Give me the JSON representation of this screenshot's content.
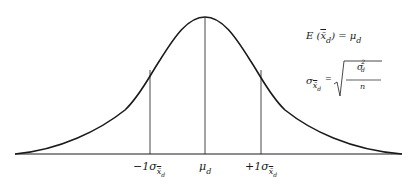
{
  "diagram": {
    "type": "normal-distribution-curve",
    "colors": {
      "line": "#1a1a1a",
      "background": "#ffffff"
    },
    "axis_labels": {
      "minus_one_sigma": {
        "prefix": "−1σ",
        "sub": "x̄",
        "subsub": "d"
      },
      "mean": {
        "main": "μ",
        "sub": "d"
      },
      "plus_one_sigma": {
        "prefix": "+1σ",
        "sub": "x̄",
        "subsub": "d"
      }
    },
    "formulas": {
      "expectation": {
        "lhs": "E (",
        "var": "x̄",
        "var_sub": "d",
        "close": ") = ",
        "rhs": "μ",
        "rhs_sub": "d"
      },
      "std_error": {
        "lhs": "σ",
        "lhs_sub": "x̄",
        "lhs_subsub": "d",
        "eq": "=",
        "numerator": "σ",
        "numerator_sup": "2",
        "numerator_sub": "d",
        "denominator": "n"
      }
    }
  }
}
